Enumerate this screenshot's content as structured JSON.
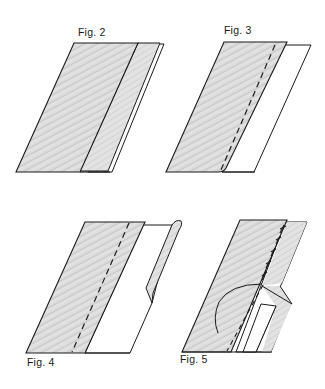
{
  "figures": [
    {
      "id": "fig2",
      "label": "Fig. 2",
      "description": "Shaded fabric strip with folded edge layered over a white backing"
    },
    {
      "id": "fig3",
      "label": "Fig. 3",
      "description": "Shaded strip with dashed stitch line over a white sheet"
    },
    {
      "id": "fig4",
      "label": "Fig. 4",
      "description": "Shaded strip with dashed stitch line, white sheet with rolled edge flap"
    },
    {
      "id": "fig5",
      "label": "Fig. 5",
      "description": "Shaded strip with hand stitches, curved thread, and folded white sheet"
    }
  ],
  "colors": {
    "background": "#ffffff",
    "line": "#1a1a1a",
    "shade": "#d6d6d6",
    "shade_dark": "#bdbdbd"
  }
}
